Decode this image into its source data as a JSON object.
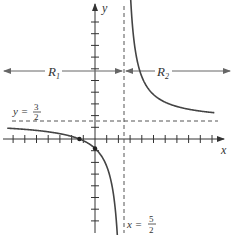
{
  "figure": {
    "axes": {
      "x_label": "x",
      "y_label": "y",
      "origin_px": [
        95,
        139
      ],
      "unit_px": 11.7,
      "x_ticks": [
        -7,
        -6,
        -5,
        -4,
        -3,
        -2,
        -1,
        1,
        2,
        3,
        4,
        5,
        6,
        7,
        8,
        9,
        10
      ],
      "y_ticks": [
        -7,
        -6,
        -5,
        -4,
        -3,
        -2,
        -1,
        1,
        2,
        3,
        4,
        5,
        6,
        7,
        8,
        9,
        10
      ]
    },
    "function": "y = (3x + 4) / (2x - 5)",
    "vertical_asymptote": {
      "label_lhs": "x =",
      "num": "5",
      "den": "2",
      "value": 2.5
    },
    "horizontal_asymptote": {
      "label_lhs": "y =",
      "num": "3",
      "den": "2",
      "value": 1.5
    },
    "regions": [
      {
        "label": "R",
        "sub": "1"
      },
      {
        "label": "R",
        "sub": "2"
      }
    ],
    "marked_points": [
      {
        "name": "x-intercept",
        "x": -1.333,
        "y": 0
      },
      {
        "name": "y-intercept",
        "x": 0,
        "y": -0.8
      }
    ],
    "colors": {
      "axis": "#333333",
      "curve": "#444444",
      "dashed": "#555555",
      "region_arrow": "#666666"
    }
  }
}
